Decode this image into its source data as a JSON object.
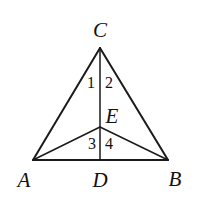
{
  "figure": {
    "background_color": "#ffffff",
    "stroke_color": "#1a1a1a",
    "text_color": "#111111",
    "canvas": {
      "width": 198,
      "height": 206
    },
    "vertices": [
      {
        "name": "A",
        "label": "A",
        "x": 33,
        "y": 160,
        "label_x": 24,
        "label_y": 180
      },
      {
        "name": "B",
        "label": "B",
        "x": 168,
        "y": 160,
        "label_x": 175,
        "label_y": 179
      },
      {
        "name": "C",
        "label": "C",
        "x": 100,
        "y": 48,
        "label_x": 100,
        "label_y": 30
      },
      {
        "name": "D",
        "label": "D",
        "x": 100,
        "y": 160,
        "label_x": 100,
        "label_y": 180
      },
      {
        "name": "E",
        "label": "E",
        "x": 100,
        "y": 127,
        "label_x": 112,
        "label_y": 116
      }
    ],
    "segments": [
      {
        "name": "side-AC",
        "x1": 33,
        "y1": 160,
        "x2": 100,
        "y2": 48
      },
      {
        "name": "side-BC",
        "x1": 168,
        "y1": 160,
        "x2": 100,
        "y2": 48
      },
      {
        "name": "side-AB",
        "x1": 33,
        "y1": 160,
        "x2": 168,
        "y2": 160
      },
      {
        "name": "cevian-CD",
        "x1": 100,
        "y1": 48,
        "x2": 100,
        "y2": 160
      },
      {
        "name": "cevian-AE",
        "x1": 33,
        "y1": 160,
        "x2": 100,
        "y2": 127
      },
      {
        "name": "cevian-BE",
        "x1": 168,
        "y1": 160,
        "x2": 100,
        "y2": 127
      }
    ],
    "angle_labels": [
      {
        "name": "angle-1",
        "label": "1",
        "x": 91,
        "y": 83
      },
      {
        "name": "angle-2",
        "label": "2",
        "x": 109,
        "y": 83
      },
      {
        "name": "angle-3",
        "label": "3",
        "x": 92,
        "y": 144
      },
      {
        "name": "angle-4",
        "label": "4",
        "x": 109,
        "y": 144
      }
    ]
  }
}
